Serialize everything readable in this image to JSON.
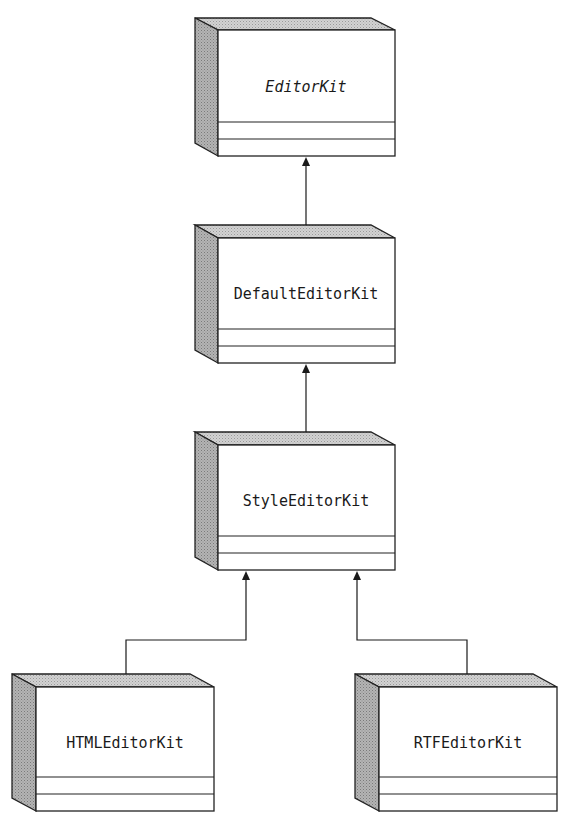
{
  "diagram": {
    "type": "UML class hierarchy",
    "colors": {
      "stroke": "#222222",
      "top_face": "#c8c8c8",
      "side_face": "#a8a8a8",
      "background": "#ffffff"
    },
    "classes": [
      {
        "id": "editorkit",
        "name": "EditorKit",
        "abstract": true
      },
      {
        "id": "defaulteditorkit",
        "name": "DefaultEditorKit",
        "abstract": false
      },
      {
        "id": "styleeditorkit",
        "name": "StyleEditorKit",
        "abstract": false
      },
      {
        "id": "htmleditorkit",
        "name": "HTMLEditorKit",
        "abstract": false
      },
      {
        "id": "rtfeditorkit",
        "name": "RTFEditorKit",
        "abstract": false
      }
    ],
    "relationships": [
      {
        "from": "DefaultEditorKit",
        "to": "EditorKit",
        "type": "inheritance"
      },
      {
        "from": "StyleEditorKit",
        "to": "DefaultEditorKit",
        "type": "inheritance"
      },
      {
        "from": "HTMLEditorKit",
        "to": "StyleEditorKit",
        "type": "inheritance"
      },
      {
        "from": "RTFEditorKit",
        "to": "StyleEditorKit",
        "type": "inheritance"
      }
    ]
  }
}
